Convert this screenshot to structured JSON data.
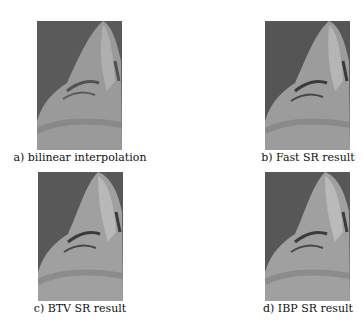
{
  "figure": {
    "panels": [
      {
        "id": "a",
        "caption": "a) bilinear interpolation"
      },
      {
        "id": "b",
        "caption": "b) Fast SR result"
      },
      {
        "id": "c",
        "caption": "c) BTV SR result"
      },
      {
        "id": "d",
        "caption": "d) IBP SR result"
      }
    ]
  }
}
